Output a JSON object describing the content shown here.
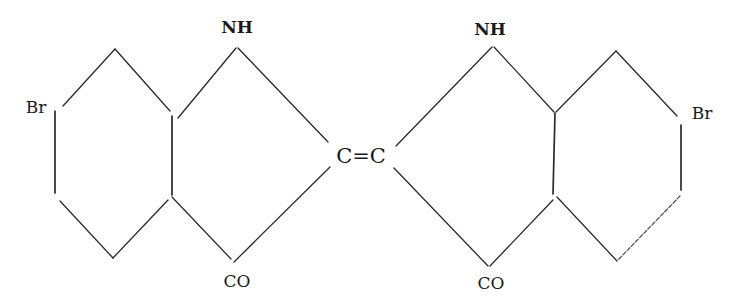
{
  "diagram": {
    "title": "",
    "type": "chemical-structure",
    "labels": {
      "nh_left": "NH",
      "nh_right": "NH",
      "co_left": "CO",
      "co_right": "CO",
      "br_left": "Br",
      "br_right": "Br",
      "center": "C=C"
    },
    "colors": {
      "line": "#2a2a2a",
      "text": "#1a1a1a",
      "background": "#ffffff"
    }
  }
}
